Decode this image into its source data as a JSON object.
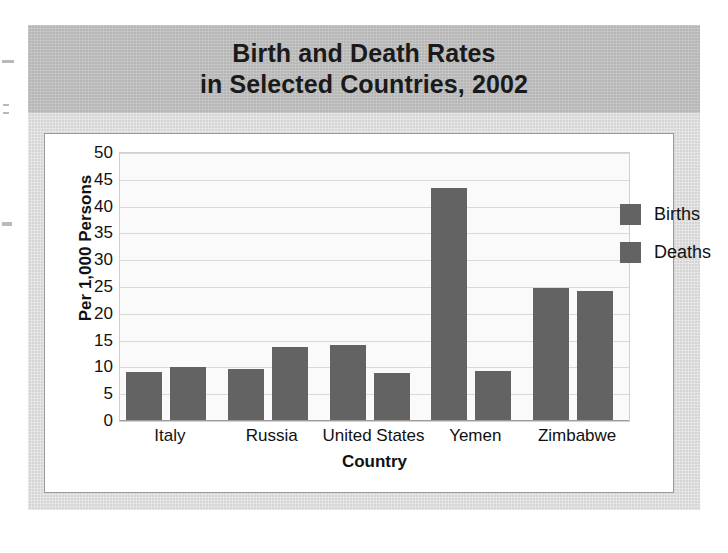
{
  "title": {
    "line1": "Birth and Death Rates",
    "line2": "in Selected Countries, 2002"
  },
  "chart_data": {
    "type": "bar",
    "title": "Birth and Death Rates in Selected Countries, 2002",
    "xlabel": "Country",
    "ylabel": "Per 1,000 Persons",
    "ylim": [
      0,
      50
    ],
    "ytick_step": 5,
    "yticks": [
      "50",
      "45",
      "40",
      "35",
      "30",
      "25",
      "20",
      "15",
      "10",
      "5",
      "0"
    ],
    "grid": true,
    "legend_position": "top-right",
    "categories": [
      "Italy",
      "Russia",
      "United States",
      "Yemen",
      "Zimbabwe"
    ],
    "series": [
      {
        "name": "Births",
        "color": "#636363",
        "values": [
          9.1,
          9.7,
          14.2,
          43.5,
          24.8
        ]
      },
      {
        "name": "Deaths",
        "color": "#636363",
        "values": [
          10.1,
          13.9,
          8.9,
          9.4,
          24.3
        ]
      }
    ]
  },
  "legend": {
    "items": [
      {
        "label": "Births"
      },
      {
        "label": "Deaths"
      }
    ]
  },
  "colors": {
    "bar": "#636363",
    "title_band": "#b6b6b6",
    "panel": "#d5d5d5",
    "card": "#ffffff",
    "plot": "#fafafa",
    "gridline": "#d9d9d9"
  }
}
